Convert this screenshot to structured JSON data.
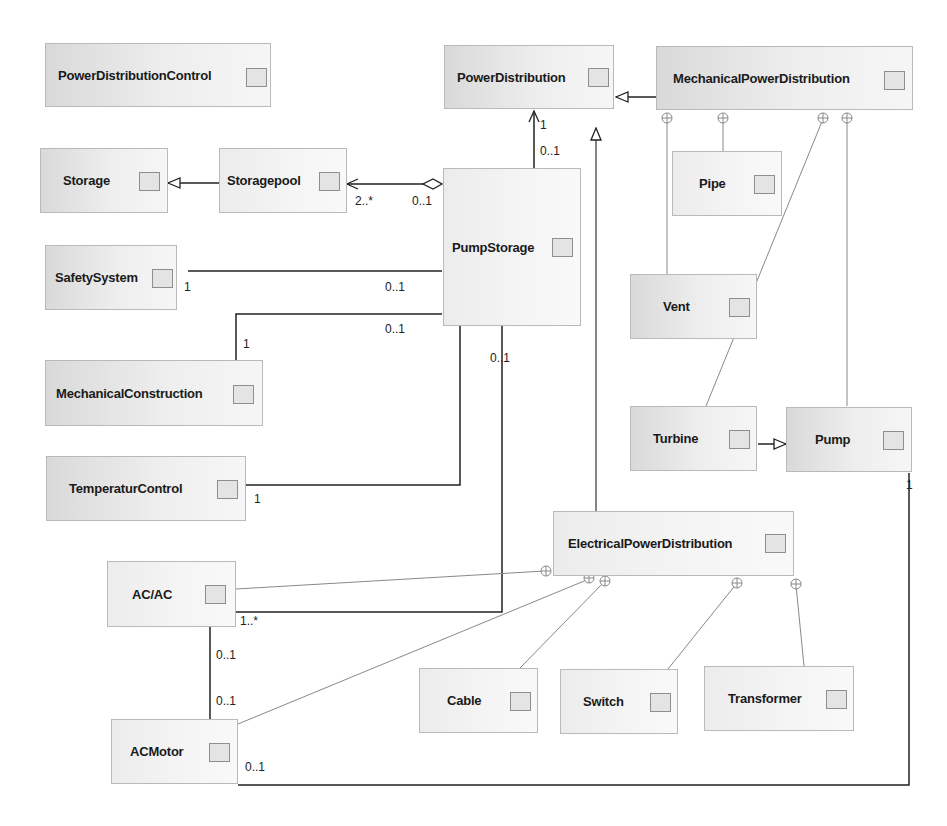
{
  "diagram": {
    "type": "UML class diagram",
    "classes": [
      {
        "id": "PowerDistributionControl",
        "label": "PowerDistributionControl"
      },
      {
        "id": "PowerDistribution",
        "label": "PowerDistribution"
      },
      {
        "id": "MechanicalPowerDistribution",
        "label": "MechanicalPowerDistribution"
      },
      {
        "id": "Storage",
        "label": "Storage"
      },
      {
        "id": "Storagepool",
        "label": "Storagepool"
      },
      {
        "id": "PumpStorage",
        "label": "PumpStorage"
      },
      {
        "id": "Pipe",
        "label": "Pipe"
      },
      {
        "id": "SafetySystem",
        "label": "SafetySystem"
      },
      {
        "id": "Vent",
        "label": "Vent"
      },
      {
        "id": "MechanicalConstruction",
        "label": "MechanicalConstruction"
      },
      {
        "id": "Turbine",
        "label": "Turbine"
      },
      {
        "id": "Pump",
        "label": "Pump"
      },
      {
        "id": "TemperaturControl",
        "label": "TemperaturControl"
      },
      {
        "id": "ElectricalPowerDistribution",
        "label": "ElectricalPowerDistribution"
      },
      {
        "id": "ACAC",
        "label": "AC/AC"
      },
      {
        "id": "Cable",
        "label": "Cable"
      },
      {
        "id": "Switch",
        "label": "Switch"
      },
      {
        "id": "Transformer",
        "label": "Transformer"
      },
      {
        "id": "ACMotor",
        "label": "ACMotor"
      }
    ],
    "relations": [
      {
        "type": "generalization",
        "from": "MechanicalPowerDistribution",
        "to": "PowerDistribution"
      },
      {
        "type": "generalization",
        "from": "ElectricalPowerDistribution",
        "to": "PowerDistribution"
      },
      {
        "type": "generalization",
        "from": "Storagepool",
        "to": "Storage"
      },
      {
        "type": "generalization",
        "from": "Turbine",
        "to": "Pump"
      },
      {
        "type": "association",
        "from": "PumpStorage",
        "to": "PowerDistribution",
        "navigable_to": "PowerDistribution",
        "from_mult": "0..1",
        "to_mult": "1"
      },
      {
        "type": "aggregation",
        "from": "PumpStorage",
        "to": "Storagepool",
        "navigable_to": "Storagepool",
        "from_mult": "0..1",
        "to_mult": "2..*"
      },
      {
        "type": "association",
        "from": "PumpStorage",
        "to": "SafetySystem",
        "from_mult": "0..1",
        "to_mult": "1"
      },
      {
        "type": "association",
        "from": "PumpStorage",
        "to": "MechanicalConstruction",
        "from_mult": "0..1",
        "to_mult": "1"
      },
      {
        "type": "association",
        "from": "PumpStorage",
        "to": "TemperaturControl",
        "to_mult": "1"
      },
      {
        "type": "association",
        "from": "PumpStorage",
        "to": "ACAC",
        "from_mult": "0..1",
        "to_mult": "1..*"
      },
      {
        "type": "association",
        "from": "ACAC",
        "to": "ACMotor",
        "from_mult": "0..1",
        "to_mult": "0..1"
      },
      {
        "type": "association",
        "from": "Pump",
        "to": "ACMotor",
        "from_mult": "1",
        "to_mult": "0..1"
      },
      {
        "type": "containment",
        "owner": "MechanicalPowerDistribution",
        "member": "Vent"
      },
      {
        "type": "containment",
        "owner": "MechanicalPowerDistribution",
        "member": "Pipe"
      },
      {
        "type": "containment",
        "owner": "MechanicalPowerDistribution",
        "member": "Turbine"
      },
      {
        "type": "containment",
        "owner": "MechanicalPowerDistribution",
        "member": "Pump"
      },
      {
        "type": "containment",
        "owner": "ElectricalPowerDistribution",
        "member": "ACAC"
      },
      {
        "type": "containment",
        "owner": "ElectricalPowerDistribution",
        "member": "ACMotor"
      },
      {
        "type": "containment",
        "owner": "ElectricalPowerDistribution",
        "member": "Cable"
      },
      {
        "type": "containment",
        "owner": "ElectricalPowerDistribution",
        "member": "Switch"
      },
      {
        "type": "containment",
        "owner": "ElectricalPowerDistribution",
        "member": "Transformer"
      }
    ],
    "multiplicities": {
      "ps_pd_top": "1",
      "ps_pd_bottom": "0..1",
      "sp_left": "2..*",
      "sp_right": "0..1",
      "ss_left": "1",
      "ss_right": "0..1",
      "mc_right": "0..1",
      "mc_left": "1",
      "ps_down": "0..1",
      "tc_left": "1",
      "acac_right": "1..*",
      "acac_down": "0..1",
      "acmotor_up": "0..1",
      "acmotor_right": "0..1",
      "pump_down": "1"
    }
  }
}
